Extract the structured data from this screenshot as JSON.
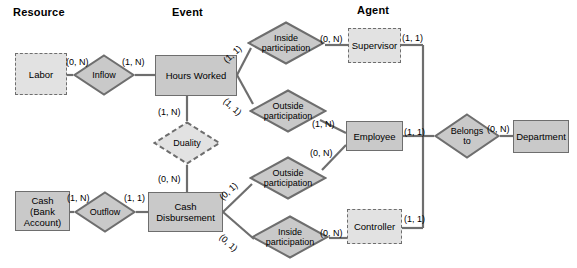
{
  "diagram": {
    "colors": {
      "entity_fill": "#c9c9c9",
      "entity_fill_dashed": "#e2e2e2",
      "stroke": "#6e6e6e",
      "diamond_fill": "#c9c9c9",
      "diamond_fill_dashed": "#e2e2e2",
      "line": "#6e6e6e",
      "text": "#000000",
      "background": "#ffffff"
    },
    "headers": [
      {
        "label": "Resource",
        "x": 13,
        "y": 6
      },
      {
        "label": "Event",
        "x": 172,
        "y": 6
      },
      {
        "label": "Agent",
        "x": 357,
        "y": 4
      }
    ],
    "entities": [
      {
        "id": "labor",
        "label": "Labor",
        "style": "dashed",
        "x": 15,
        "y": 53,
        "w": 52,
        "h": 42
      },
      {
        "id": "hours-worked",
        "label": "Hours Worked",
        "style": "solid",
        "x": 155,
        "y": 55,
        "w": 82,
        "h": 41
      },
      {
        "id": "supervisor",
        "label": "Supervisor",
        "style": "dashed",
        "x": 348,
        "y": 28,
        "w": 53,
        "h": 35
      },
      {
        "id": "employee",
        "label": "Employee",
        "style": "solid",
        "x": 346,
        "y": 121,
        "w": 57,
        "h": 30
      },
      {
        "id": "department",
        "label": "Department",
        "style": "solid",
        "x": 513,
        "y": 120,
        "w": 56,
        "h": 33
      },
      {
        "id": "cash",
        "label": "Cash\n(Bank\nAccount)",
        "style": "solid",
        "x": 15,
        "y": 191,
        "w": 55,
        "h": 40
      },
      {
        "id": "cash-disbursement",
        "label": "Cash\nDisbursement",
        "style": "solid",
        "x": 148,
        "y": 192,
        "w": 75,
        "h": 40
      },
      {
        "id": "controller",
        "label": "Controller",
        "style": "dashed",
        "x": 347,
        "y": 209,
        "w": 55,
        "h": 35
      }
    ],
    "relationships": [
      {
        "id": "inflow",
        "label": "Inflow",
        "style": "solid",
        "cx": 104,
        "cy": 75,
        "rx": 31,
        "ry": 21
      },
      {
        "id": "duality",
        "label": "Duality",
        "style": "dashed",
        "cx": 187,
        "cy": 143,
        "rx": 34,
        "ry": 22
      },
      {
        "id": "outflow",
        "label": "Outflow",
        "style": "solid",
        "cx": 105,
        "cy": 212,
        "rx": 31,
        "ry": 21
      },
      {
        "id": "inside-participation-1",
        "label": "Inside\nparticipation",
        "style": "solid",
        "cx": 286,
        "cy": 43,
        "rx": 39,
        "ry": 22
      },
      {
        "id": "outside-participation-1",
        "label": "Outside\nparticipation",
        "style": "solid",
        "cx": 288,
        "cy": 111,
        "rx": 39,
        "ry": 22
      },
      {
        "id": "outside-participation-2",
        "label": "Outside\nparticipation",
        "style": "solid",
        "cx": 288,
        "cy": 178,
        "rx": 39,
        "ry": 22
      },
      {
        "id": "inside-participation-2",
        "label": "Inside\nparticipation",
        "style": "solid",
        "cx": 290,
        "cy": 237,
        "rx": 39,
        "ry": 22
      },
      {
        "id": "belongs-to",
        "label": "Belongs\nto",
        "style": "solid",
        "cx": 467,
        "cy": 136,
        "rx": 33,
        "ry": 23
      }
    ],
    "cardinalities": [
      {
        "id": "labor-inflow",
        "text": "(0, N)",
        "x": 66,
        "y": 57,
        "rot": "none"
      },
      {
        "id": "inflow-hours",
        "text": "(1, N)",
        "x": 122,
        "y": 57,
        "rot": "none"
      },
      {
        "id": "hours-duality",
        "text": "(1, N)",
        "x": 158,
        "y": 107,
        "rot": "none"
      },
      {
        "id": "duality-cash-disb",
        "text": "(0, N)",
        "x": 158,
        "y": 174,
        "rot": "none"
      },
      {
        "id": "hours-inside-1",
        "text": "(1, 1)",
        "x": 228,
        "y": 55,
        "rot": "up"
      },
      {
        "id": "hours-outside-1",
        "text": "(1, 1)",
        "x": 228,
        "y": 96,
        "rot": "dn"
      },
      {
        "id": "inside1-supervisor",
        "text": "(0, N)",
        "x": 320,
        "y": 34,
        "rot": "none"
      },
      {
        "id": "supervisor-line",
        "text": "(1, 1)",
        "x": 402,
        "y": 33,
        "rot": "none"
      },
      {
        "id": "outside1-employee",
        "text": "(1, N)",
        "x": 312,
        "y": 119,
        "rot": "none"
      },
      {
        "id": "outside2-employee",
        "text": "(0, N)",
        "x": 310,
        "y": 148,
        "rot": "none"
      },
      {
        "id": "employee-line",
        "text": "(1, 1)",
        "x": 404,
        "y": 127,
        "rot": "none"
      },
      {
        "id": "belongsto-department",
        "text": "(0, N)",
        "x": 487,
        "y": 124,
        "rot": "none"
      },
      {
        "id": "cash-outflow",
        "text": "(1, N)",
        "x": 67,
        "y": 193,
        "rot": "none"
      },
      {
        "id": "outflow-cashdisb",
        "text": "(1, 1)",
        "x": 124,
        "y": 193,
        "rot": "none"
      },
      {
        "id": "cashdisb-outside-2",
        "text": "(0, 1)",
        "x": 224,
        "y": 192,
        "rot": "up"
      },
      {
        "id": "cashdisb-inside-2",
        "text": "(0, 1)",
        "x": 224,
        "y": 232,
        "rot": "dn"
      },
      {
        "id": "inside2-controller",
        "text": "(0, N)",
        "x": 320,
        "y": 228,
        "rot": "none"
      },
      {
        "id": "controller-line",
        "text": "(1, 1)",
        "x": 404,
        "y": 214,
        "rot": "none"
      }
    ]
  }
}
